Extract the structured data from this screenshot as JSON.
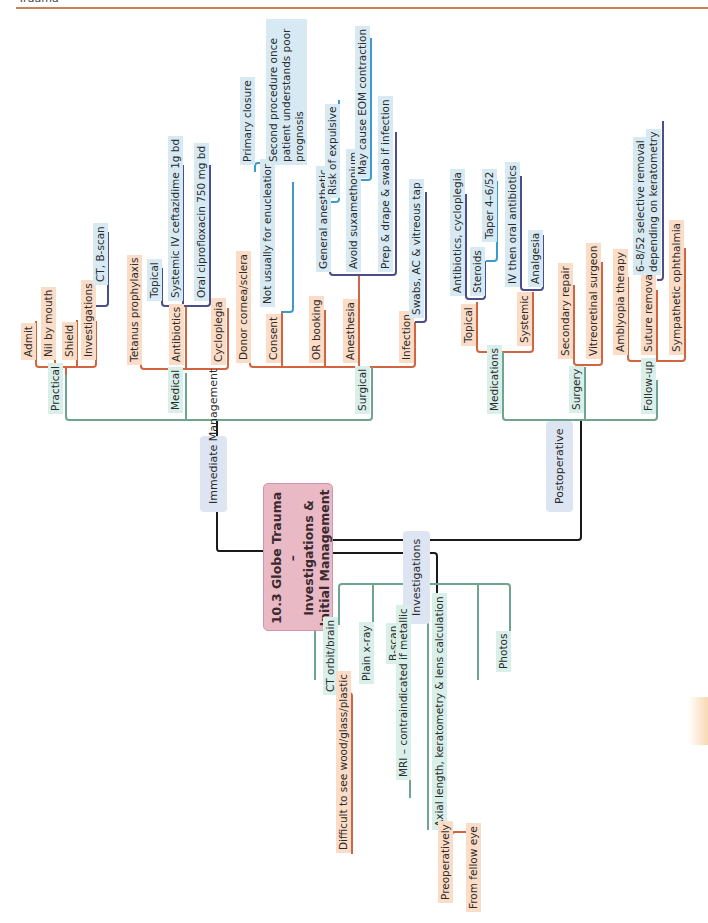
{
  "header": {
    "section": "Trauma",
    "rule_color": "#c9825a"
  },
  "title": {
    "line1": "10.3 Globe Trauma –",
    "line2": "Investigations &",
    "line3": "Initial Management"
  },
  "colors": {
    "title_bg": "#e9b9c6",
    "group_bg": "#dde4f2",
    "green_line": "#6fa58e",
    "orange_line": "#d2643f",
    "navy_line": "#4a4f8c",
    "blue_line": "#3c9cc9",
    "black_line": "#1a1a1a"
  },
  "groups": {
    "immediate": "Immediate Management",
    "postoperative": "Postoperative",
    "investigations": "Investigations"
  },
  "immediate": {
    "practical": {
      "label": "Practical",
      "items": [
        "Admit",
        "Nil by mouth",
        "Shield",
        "Investigations"
      ],
      "investigations_detail": "CT, B-scan"
    },
    "medical": {
      "label": "Medical",
      "items": [
        "Tetanus prophylaxis",
        "Antibiotics",
        "Cycloplegia"
      ],
      "antibiotics": [
        "Topical",
        "Systemic IV ceftazidime 1g bd",
        "Oral ciprofloxacin 750 mg bd"
      ]
    },
    "surgical": {
      "label": "Surgical",
      "items": [
        "Donor cornea/sclera",
        "Consent",
        "OR booking",
        "Anesthesia",
        "Infection"
      ],
      "consent": {
        "detail": "Not usually for enucleation",
        "sub": [
          "Primary closure",
          "Second procedure once patient understands poor prognosis"
        ]
      },
      "anesthesia": {
        "items": [
          "General anesthetic",
          "Avoid suxamethonium",
          "Prep & drape & swab if infection"
        ],
        "ga_detail": "Risk of expulsive",
        "sux_detail": "May cause EOM contraction"
      },
      "infection_detail": "Swabs, AC & vitreous tap"
    }
  },
  "postoperative": {
    "medications": {
      "label": "Medications",
      "topical": {
        "label": "Topical",
        "items": [
          "Antibiotics, cycloplegia",
          "Steroids"
        ],
        "steroids_detail": "Taper 4–6/52"
      },
      "systemic": {
        "label": "Systemic",
        "items": [
          "IV then oral antibiotics",
          "Analgesia"
        ]
      }
    },
    "surgery": {
      "label": "Surgery",
      "items": [
        "Secondary repair",
        "Vitreoretinal surgeon"
      ]
    },
    "followup": {
      "label": "Follow-up",
      "items": [
        "Amblyopia therapy",
        "Suture removal",
        "Sympathetic ophthalmia"
      ],
      "suture_detail_1": "6–8/52 selective removal",
      "suture_detail_2": "depending on keratometry"
    }
  },
  "investigations": {
    "items": [
      "CT orbit/brain",
      "Plain x-ray",
      "B-scan",
      "MRI – contraindicated if metallic",
      "Axial length, keratometry & lens calculation",
      "Photos"
    ],
    "ct_detail": "Difficult to see wood/glass/plastic",
    "axial_sub": [
      "Preoperatively",
      "From fellow eye"
    ]
  }
}
